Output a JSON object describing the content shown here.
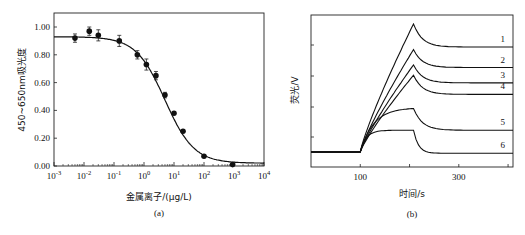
{
  "chart_data": [
    {
      "type": "scatter",
      "panel_label": "(a)",
      "title": "",
      "xlabel": "金属离子/(μg/L)",
      "ylabel": "450~650nm吸光度",
      "xscale": "log",
      "xlim": [
        0.001,
        10000
      ],
      "ylim": [
        0.0,
        1.1
      ],
      "x_ticks": [
        "10^-3",
        "10^-2",
        "10^-1",
        "10^0",
        "10^1",
        "10^2",
        "10^3",
        "10^4"
      ],
      "y_ticks": [
        "0.00",
        "0.20",
        "0.40",
        "0.60",
        "0.80",
        "1.00"
      ],
      "grid": false,
      "series": [
        {
          "name": "measured",
          "marker": "filled-circle",
          "error_bars": true,
          "points": [
            {
              "x": 0.005,
              "y": 0.92,
              "err": 0.03
            },
            {
              "x": 0.015,
              "y": 0.97,
              "err": 0.03
            },
            {
              "x": 0.03,
              "y": 0.94,
              "err": 0.04
            },
            {
              "x": 0.15,
              "y": 0.9,
              "err": 0.04
            },
            {
              "x": 0.6,
              "y": 0.8,
              "err": 0.03
            },
            {
              "x": 1.2,
              "y": 0.73,
              "err": 0.04
            },
            {
              "x": 2.5,
              "y": 0.65,
              "err": 0.03
            },
            {
              "x": 5,
              "y": 0.51,
              "err": 0.02
            },
            {
              "x": 10,
              "y": 0.38,
              "err": 0.01
            },
            {
              "x": 20,
              "y": 0.25,
              "err": 0.01
            },
            {
              "x": 100,
              "y": 0.07,
              "err": 0.005
            },
            {
              "x": 900,
              "y": 0.01,
              "err": 0.005
            }
          ]
        },
        {
          "name": "fit",
          "type": "line",
          "model": "sigmoid",
          "top": 0.93,
          "bottom": 0.02,
          "ec50": 5,
          "hill": 0.9
        }
      ]
    },
    {
      "type": "line",
      "panel_label": "(b)",
      "title": "",
      "xlabel": "时间/s",
      "ylabel": "荧光/V",
      "xlim": [
        0,
        410
      ],
      "x_ticks": [
        "100",
        "300"
      ],
      "y_ticks_labeled": false,
      "grid": false,
      "legend": "curve numbers at right end",
      "series": [
        {
          "name": "1",
          "baseline": 0.0,
          "peak": 1.0,
          "plateau": 0.82
        },
        {
          "name": "2",
          "baseline": 0.0,
          "peak": 0.8,
          "plateau": 0.66
        },
        {
          "name": "3",
          "baseline": 0.0,
          "peak": 0.68,
          "plateau": 0.54
        },
        {
          "name": "4",
          "baseline": 0.0,
          "peak": 0.6,
          "plateau": 0.45
        },
        {
          "name": "5",
          "baseline": 0.0,
          "peak": 0.34,
          "plateau": 0.17
        },
        {
          "name": "6",
          "baseline": 0.0,
          "peak": 0.17,
          "plateau": -0.01
        }
      ],
      "event_times_s": {
        "rise_start": 100,
        "peak": 208
      }
    }
  ]
}
